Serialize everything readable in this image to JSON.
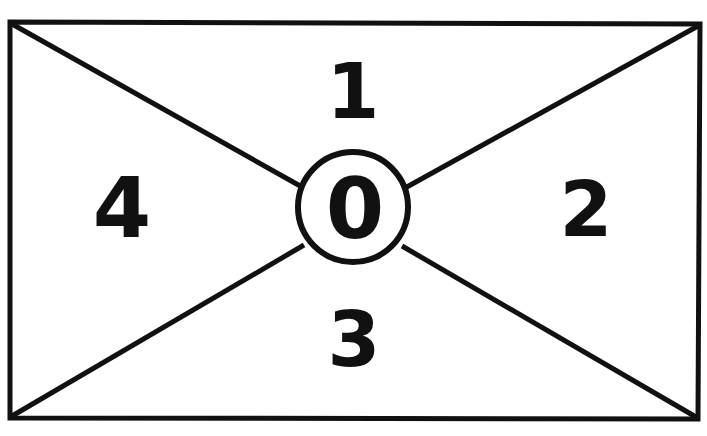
{
  "diagram": {
    "type": "rectangle-with-diagonals",
    "stroke_color": "#111111",
    "background": "#ffffff",
    "center_label": "0",
    "regions": [
      {
        "id": "top",
        "label": "1"
      },
      {
        "id": "right",
        "label": "2"
      },
      {
        "id": "bottom",
        "label": "3"
      },
      {
        "id": "left",
        "label": "4"
      }
    ]
  }
}
